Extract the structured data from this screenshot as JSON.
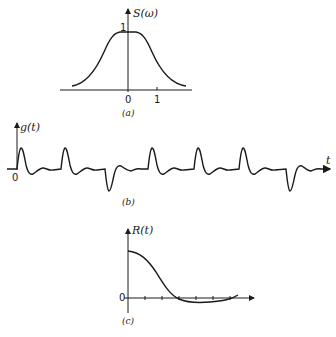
{
  "panel_a": {
    "ylabel": "S(ω)",
    "peak_label": "1",
    "tick_0": "0",
    "tick_1": "1",
    "caption": "(a)"
  },
  "panel_b": {
    "ylabel": "g(t)",
    "origin_label": "0",
    "xlabel": "t",
    "caption": "(b)"
  },
  "panel_c": {
    "ylabel": "R(t)",
    "origin_label": "0",
    "caption": "(c)"
  },
  "colors": {
    "ink": "#1a1a1a",
    "background": "#ffffff"
  }
}
